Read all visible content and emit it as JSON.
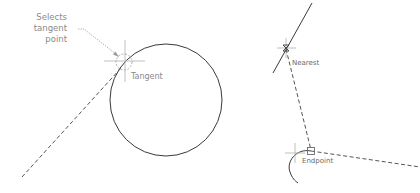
{
  "diagram": {
    "type": "cad-object-snap-illustration",
    "left_panel": {
      "annotation_lines": [
        "Selects",
        "tangent",
        "point"
      ],
      "snap_label": "Tangent",
      "objects": [
        "circle",
        "dashed tangent line",
        "aperture crosshair",
        "tangent marker circle",
        "leader arrow"
      ]
    },
    "right_panel": {
      "snap_labels": {
        "nearest": "Nearest",
        "endpoint": "Endpoint"
      },
      "objects": [
        "solid line",
        "dashed line to nearest point",
        "dashed line from endpoint",
        "arc",
        "endpoint marker square",
        "aperture crosshairs"
      ]
    },
    "colors": {
      "background": "#ffffff",
      "geometry": "#3a3a3a",
      "annotation": "#8a8a8a",
      "crosshair": "#b0b0b0"
    }
  }
}
